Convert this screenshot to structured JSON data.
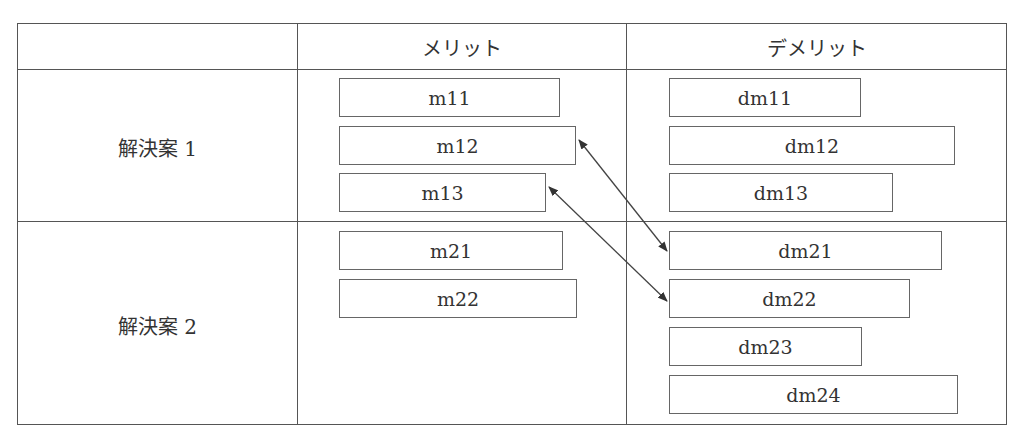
{
  "table": {
    "headers": [
      "",
      "メリット",
      "デメリット"
    ],
    "rows": [
      {
        "label": "解決案 1",
        "merits": [
          "m11",
          "m12",
          "m13"
        ],
        "demerits": [
          "dm11",
          "dm12",
          "dm13"
        ]
      },
      {
        "label": "解決案 2",
        "merits": [
          "m21",
          "m22"
        ],
        "demerits": [
          "dm21",
          "dm22",
          "dm23",
          "dm24"
        ]
      }
    ]
  },
  "relations": [
    {
      "from": "m12",
      "to": "dm21",
      "type": "bidirectional"
    },
    {
      "from": "m13",
      "to": "dm22",
      "type": "bidirectional"
    }
  ]
}
